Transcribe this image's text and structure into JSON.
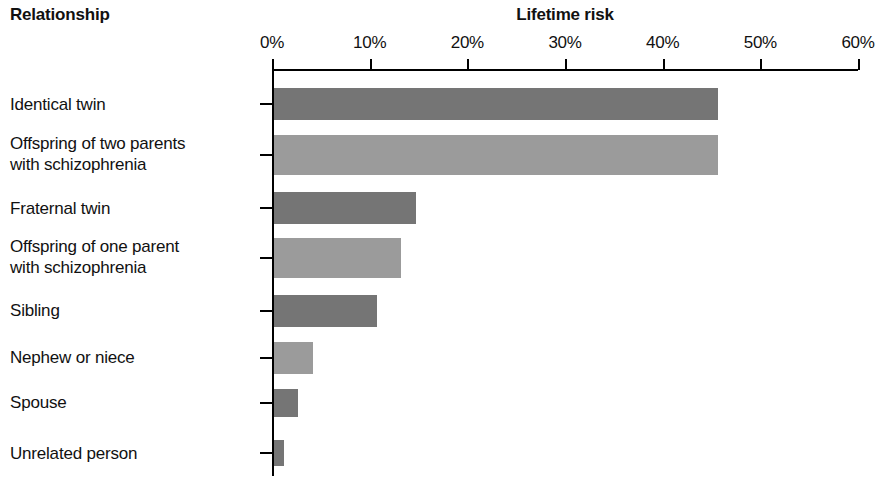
{
  "headings": {
    "left": "Relationship",
    "chart_title": "Lifetime risk"
  },
  "chart_data": {
    "type": "bar",
    "orientation": "horizontal",
    "title": "Lifetime risk",
    "xlabel": "Lifetime risk",
    "ylabel": "Relationship",
    "xlim": [
      0,
      60
    ],
    "xtick_labels": [
      "0%",
      "10%",
      "20%",
      "30%",
      "40%",
      "50%",
      "60%"
    ],
    "xticks": [
      0,
      10,
      20,
      30,
      40,
      50,
      60
    ],
    "grid": false,
    "legend": false,
    "categories": [
      "Identical twin",
      "Offspring of two parents\nwith schizophrenia",
      "Fraternal twin",
      "Offspring of one parent\nwith schizophrenia",
      "Sibling",
      "Nephew or niece",
      "Spouse",
      "Unrelated person"
    ],
    "values": [
      45.5,
      45.5,
      14.5,
      13,
      10.5,
      4,
      2.5,
      1
    ],
    "bar_colors": [
      "#757575",
      "#9b9b9b",
      "#757575",
      "#9b9b9b",
      "#757575",
      "#9b9b9b",
      "#757575",
      "#757575"
    ]
  },
  "colors": {
    "bar_dark": "#757575",
    "bar_light": "#9b9b9b",
    "axis": "#000000",
    "text": "#111111",
    "background": "#ffffff"
  }
}
